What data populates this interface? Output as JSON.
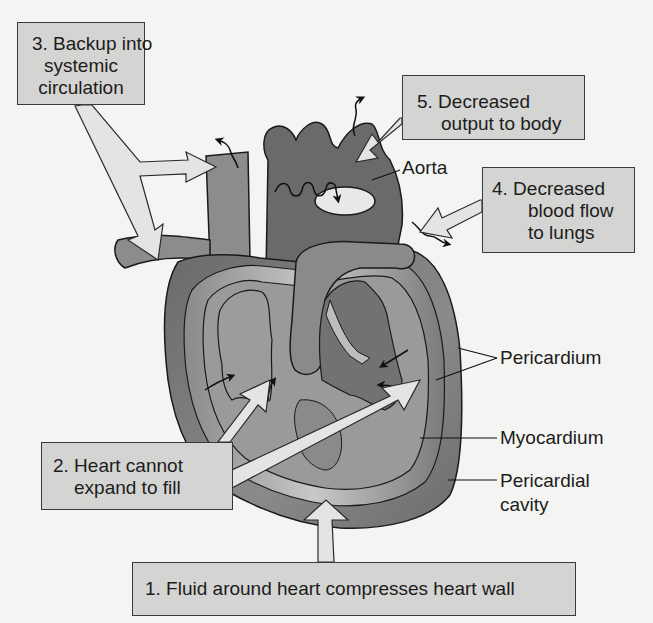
{
  "diagram": {
    "colors": {
      "background": "#f4f4f2",
      "callout_fill": "#d4d4d2",
      "callout_border": "#3a3a3a",
      "pericardium_dark": "#6e6e6e",
      "myocardium": "#8a8a8a",
      "chamber_light": "#9a9a9a",
      "fluid_light": "#bdbdbd",
      "vessel": "#7c7c7c",
      "arrow_fill": "#e4e4e2"
    },
    "callouts": [
      {
        "id": "1",
        "lines": [
          "1. Fluid around heart compresses heart wall"
        ]
      },
      {
        "id": "2",
        "lines": [
          "2. Heart cannot",
          "expand to fill"
        ]
      },
      {
        "id": "3",
        "lines": [
          "3. Backup into",
          "systemic",
          "circulation"
        ]
      },
      {
        "id": "4",
        "lines": [
          "4. Decreased",
          "blood flow",
          "to lungs"
        ]
      },
      {
        "id": "5",
        "lines": [
          "5. Decreased",
          "output to body"
        ]
      }
    ],
    "labels": {
      "aorta": "Aorta",
      "pericardium": "Pericardium",
      "myocardium": "Myocardium",
      "pericardial_cavity": [
        "Pericardial",
        "cavity"
      ]
    }
  }
}
